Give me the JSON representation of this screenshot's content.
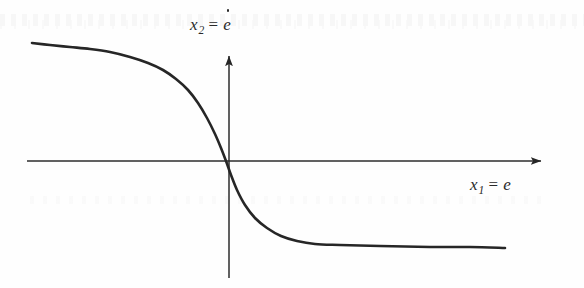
{
  "figure": {
    "background_color": "#fefefe",
    "ink_color": "#2a2a2a",
    "y_axis_label": {
      "variable": "x",
      "subscript": "2",
      "equals": "=",
      "value": "e",
      "value_has_dot": true,
      "full_text": "x2 = ė"
    },
    "x_axis_label": {
      "variable": "x",
      "subscript": "1",
      "equals": "=",
      "value": "e",
      "value_has_dot": false,
      "full_text": "x1 = e"
    }
  },
  "chart_data": {
    "type": "line",
    "title": "",
    "xlabel": "x1 = e",
    "ylabel": "x2 = ė",
    "grid": false,
    "legend": null,
    "annotations": [],
    "axes": {
      "x_axis": {
        "type": "arrow",
        "origin_px": [
          229,
          161
        ],
        "start_px": [
          27,
          161
        ],
        "end_px": [
          545,
          161
        ],
        "arrow_at": "end",
        "tick_labels": []
      },
      "y_axis": {
        "type": "arrow",
        "origin_px": [
          229,
          161
        ],
        "start_px": [
          229,
          278
        ],
        "end_px": [
          229,
          52
        ],
        "arrow_at": "end",
        "tick_labels": []
      }
    },
    "xlim": [
      -1,
      1
    ],
    "ylim": [
      -1.1,
      1.1
    ],
    "series": [
      {
        "name": "saturating decreasing nonlinearity",
        "description": "Monotonically decreasing sigmoid through the origin, saturating at a positive constant for large negative x and a negative constant for large positive x",
        "color": "#262626",
        "linewidth_px": 2.6,
        "points_px": [
          [
            32,
            43
          ],
          [
            50,
            45
          ],
          [
            70,
            47
          ],
          [
            90,
            49
          ],
          [
            110,
            52
          ],
          [
            130,
            57
          ],
          [
            148,
            63
          ],
          [
            163,
            70
          ],
          [
            176,
            79
          ],
          [
            188,
            90
          ],
          [
            198,
            103
          ],
          [
            207,
            118
          ],
          [
            215,
            134
          ],
          [
            221,
            148
          ],
          [
            226,
            161
          ],
          [
            231,
            175
          ],
          [
            237,
            190
          ],
          [
            245,
            205
          ],
          [
            255,
            218
          ],
          [
            267,
            228
          ],
          [
            281,
            236
          ],
          [
            297,
            241
          ],
          [
            315,
            244
          ],
          [
            340,
            245
          ],
          [
            380,
            246
          ],
          [
            430,
            247
          ],
          [
            470,
            247
          ],
          [
            505,
            248
          ]
        ]
      }
    ]
  }
}
